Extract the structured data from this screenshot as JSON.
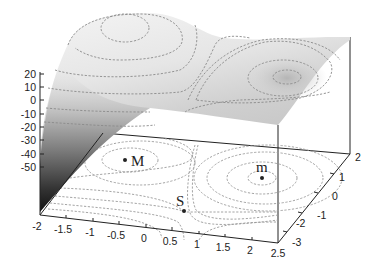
{
  "chart_data": {
    "type": "surface3d",
    "title": "",
    "x_axis": {
      "label": "",
      "range": [
        -2,
        2.5
      ],
      "ticks": [
        "-2",
        "-1.5",
        "-1",
        "-0.5",
        "0",
        "0.5",
        "1",
        "1.5",
        "2",
        "2.5"
      ]
    },
    "y_axis": {
      "label": "",
      "range": [
        -3.5,
        2
      ],
      "ticks": [
        "2",
        "1",
        "0",
        "-1",
        "-2",
        "-3"
      ]
    },
    "z_axis": {
      "label": "",
      "range": [
        -50,
        20
      ],
      "ticks": [
        "20",
        "10",
        "0",
        "-10",
        "-20",
        "-30",
        "-40",
        "-50"
      ]
    },
    "critical_points": [
      {
        "label": "M",
        "type": "maximum",
        "x": -0.5,
        "y": 1.0
      },
      {
        "label": "S",
        "type": "saddle",
        "x": 0.75,
        "y": -1.0
      },
      {
        "label": "m",
        "type": "minimum",
        "x": 2.0,
        "y": 0.5
      }
    ],
    "colormap": "grayscale",
    "contours": {
      "on_surface": true,
      "projected_on_floor": true,
      "style": "dashed"
    },
    "grid": false,
    "legend": "none"
  },
  "labels": {
    "z_ticks": [
      "20",
      "10",
      "0",
      "-10",
      "-20",
      "-30",
      "-40",
      "-50"
    ],
    "x_ticks": [
      "-2",
      "-1.5",
      "-1",
      "-0.5",
      "0",
      "0.5",
      "1",
      "1.5",
      "2",
      "2.5"
    ],
    "y_ticks": [
      "2",
      "1",
      "0",
      "-1",
      "-2",
      "-3"
    ],
    "points": {
      "max": "M",
      "saddle": "S",
      "min": "m"
    }
  }
}
